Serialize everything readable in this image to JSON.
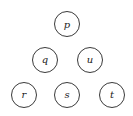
{
  "diagram": {
    "type": "node-layout",
    "nodes": [
      {
        "id": "p",
        "label": "p",
        "cx": 67,
        "cy": 24
      },
      {
        "id": "q",
        "label": "q",
        "cx": 45,
        "cy": 60
      },
      {
        "id": "u",
        "label": "u",
        "cx": 90,
        "cy": 60
      },
      {
        "id": "r",
        "label": "r",
        "cx": 24,
        "cy": 95
      },
      {
        "id": "s",
        "label": "s",
        "cx": 67,
        "cy": 95
      },
      {
        "id": "t",
        "label": "t",
        "cx": 112,
        "cy": 95
      }
    ],
    "edges": [],
    "node_radius": 12.5,
    "stroke_color": "#3a3a3a",
    "background": "#ffffff"
  }
}
